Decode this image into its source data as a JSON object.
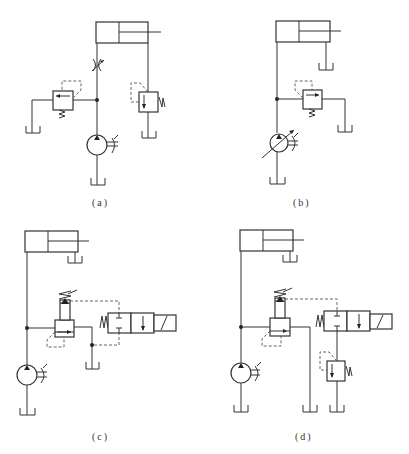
{
  "figure": {
    "panels": [
      {
        "id": "a",
        "label": "(a)",
        "description": "Fixed pump, throttle valve in supply line, relief valve bypass to tank, back-pressure valve on return line"
      },
      {
        "id": "b",
        "label": "(b)",
        "description": "Variable pump with relief valve, rod side to tank"
      },
      {
        "id": "c",
        "label": "(c)",
        "description": "Pilot-operated relief valve with solenoid 2-position directional valve venting pilot to tank"
      },
      {
        "id": "d",
        "label": "(d)",
        "description": "Pilot-operated relief valve with solenoid directional valve connected to remote direct relief valve"
      }
    ],
    "colors": {
      "line": "#333333",
      "dashed": "#555555",
      "background": "#ffffff"
    }
  }
}
